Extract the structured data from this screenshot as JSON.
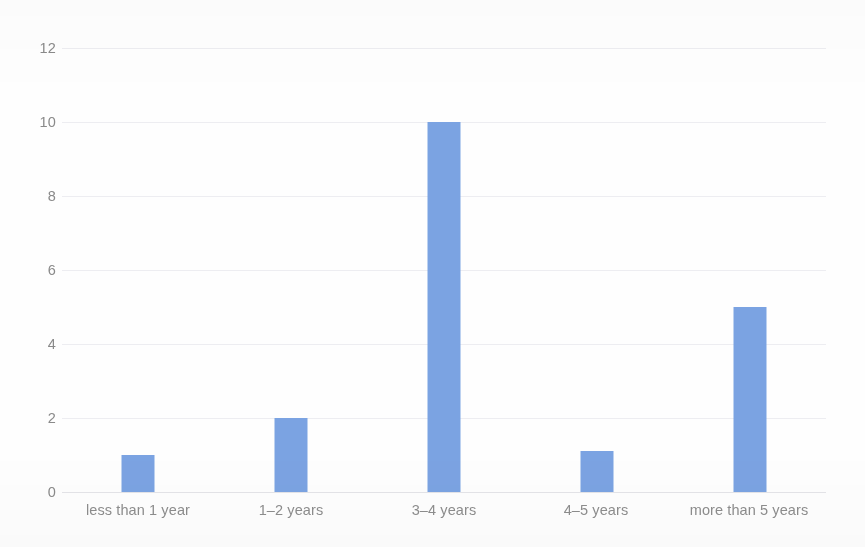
{
  "chart_data": {
    "type": "bar",
    "title": "",
    "subtitle": "",
    "xlabel": "",
    "ylabel": "",
    "categories": [
      "less than 1 year",
      "1–2 years",
      "3–4 years",
      "4–5 years",
      "more than 5 years"
    ],
    "values": [
      1,
      2,
      10,
      1.1,
      5
    ],
    "series": [
      {
        "name": "",
        "values": [
          1,
          2,
          10,
          1.1,
          5
        ]
      }
    ],
    "ylim": [
      0,
      12
    ],
    "yticks": [
      0,
      2,
      4,
      6,
      8,
      10,
      12
    ],
    "ytick_labels": [
      "0",
      "2",
      "4",
      "6",
      "8",
      "10",
      "12"
    ],
    "grid": true,
    "grid_axis": "y",
    "legend": false,
    "legend_position": "none",
    "annotations": [],
    "colors": {
      "bar": "#7ba3e2",
      "gridline": "#ededf1",
      "baseline": "#e4e4e8",
      "tick_text": "#8a8a8a",
      "category_text": "#8d8d8d",
      "background": "#fefefe"
    }
  }
}
